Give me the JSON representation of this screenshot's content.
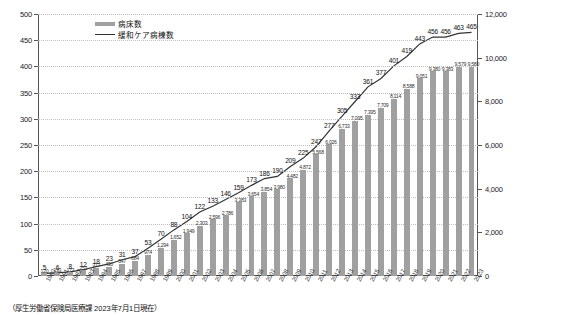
{
  "legend": {
    "bar_label": "病床数",
    "line_label": "緩和ケア病棟数",
    "position": "top-left-inside"
  },
  "caption": "（厚生労働省保険局医療課 2023年7月1日現在）",
  "axes": {
    "left_title": "",
    "right_title": "",
    "left_ticks": [
      "0",
      "50",
      "100",
      "150",
      "200",
      "250",
      "300",
      "350",
      "400",
      "450",
      "500"
    ],
    "right_ticks": [
      "0",
      "2,000",
      "4,000",
      "6,000",
      "8,000",
      "10,000",
      "12,000"
    ],
    "left_min": 0,
    "left_max": 500,
    "right_min": 0,
    "right_max": 12000
  },
  "chart_data": {
    "type": "bar",
    "title": "",
    "xlabel": "",
    "ylabel": "緩和ケア病棟数",
    "y2label": "病床数",
    "ylim": [
      0,
      500
    ],
    "y2lim": [
      0,
      12000
    ],
    "grid": true,
    "legend_position": "top-left",
    "categories": [
      "1990",
      "1991",
      "1992",
      "1993",
      "1994",
      "1995",
      "1996",
      "1997",
      "1998",
      "1999",
      "2000",
      "2001",
      "2002",
      "2003",
      "2004",
      "2005",
      "2006",
      "2007",
      "2008",
      "2009",
      "2010",
      "2011",
      "2012",
      "2013",
      "2014",
      "2015",
      "2016",
      "2017",
      "2018",
      "2019",
      "2020",
      "2021",
      "2022",
      "2023"
    ],
    "series": [
      {
        "name": "病床数",
        "type": "bar",
        "axis": "right",
        "color": "#a0a0a0",
        "values": [
          120,
          133,
          173,
          253,
          377,
          430,
          547,
          684,
          974,
          1294,
          1652,
          1949,
          2303,
          2596,
          2786,
          3383,
          3654,
          3854,
          3980,
          4482,
          4872,
          5568,
          6026,
          6733,
          7095,
          7395,
          7709,
          8114,
          8588,
          9051,
          9380,
          9383,
          9579,
          9580
        ],
        "labels": [
          "120",
          "133",
          "173",
          "253",
          "377",
          "430",
          "547",
          "684",
          "974",
          "1,294",
          "1,652",
          "1,949",
          "2,303",
          "2,596",
          "2,786",
          "3,383",
          "3,654",
          "3,854",
          "3,980",
          "4,482",
          "4,872",
          "5,568",
          "6,026",
          "6,733",
          "7,095",
          "7,395",
          "7,709",
          "8,114",
          "8,588",
          "9,051",
          "9,380",
          "9,383",
          "9,579",
          "9,580"
        ]
      },
      {
        "name": "緩和ケア病棟数",
        "type": "line",
        "axis": "left",
        "color": "#333333",
        "values": [
          5,
          6,
          8,
          12,
          18,
          23,
          31,
          37,
          53,
          70,
          88,
          104,
          122,
          133,
          146,
          159,
          173,
          186,
          190,
          209,
          225,
          247,
          277,
          305,
          333,
          361,
          377,
          401,
          419,
          443,
          456,
          456,
          463,
          465
        ],
        "labels": [
          "5",
          "6",
          "8",
          "12",
          "18",
          "23",
          "31",
          "37",
          "53",
          "70",
          "88",
          "104",
          "122",
          "133",
          "146",
          "159",
          "173",
          "186",
          "190",
          "209",
          "225",
          "247",
          "277",
          "305",
          "333",
          "361",
          "377",
          "401",
          "419",
          "443",
          "456",
          "456",
          "463",
          "465"
        ]
      }
    ]
  }
}
